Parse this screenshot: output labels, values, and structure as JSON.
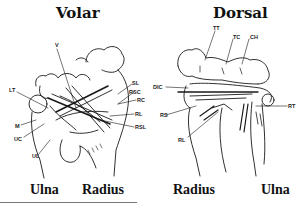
{
  "panels": {
    "volar": {
      "title": "Volar",
      "bottom_left": "Ulna",
      "bottom_right": "Radius",
      "labels": [
        "V",
        "SL",
        "RSC",
        "RC",
        "RL",
        "RSL",
        "LT",
        "M",
        "UC",
        "UL"
      ]
    },
    "dorsal": {
      "title": "Dorsal",
      "bottom_left": "Radius",
      "bottom_right": "Ulna",
      "labels": [
        "TT",
        "TC",
        "CH",
        "DIC",
        "RS",
        "RL",
        "RT"
      ]
    }
  }
}
